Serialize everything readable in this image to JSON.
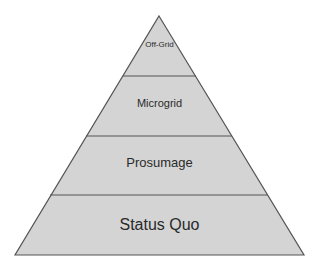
{
  "diagram": {
    "type": "pyramid",
    "fill_color": "#d4d4d4",
    "outline_color": "#555555",
    "levels": [
      {
        "label": "Off-Grid"
      },
      {
        "label": "Microgrid"
      },
      {
        "label": "Prosumage"
      },
      {
        "label": "Status Quo"
      }
    ]
  }
}
